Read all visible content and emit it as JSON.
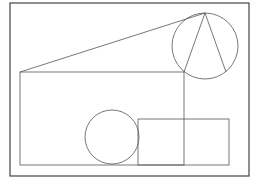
{
  "diagram": {
    "type": "geometry-figure",
    "stroke_color": "#555555",
    "frame_color": "#444444",
    "background": "#ffffff",
    "frame": {
      "x": 10,
      "y": 3,
      "width": 239,
      "height": 173
    },
    "shapes": {
      "large_circle": {
        "cx": 205,
        "cy": 46,
        "r": 33
      },
      "small_circle": {
        "cx": 112,
        "cy": 137,
        "r": 27
      },
      "triangle": {
        "points": "205,13 184,72 226,72"
      },
      "tangent_line": {
        "x1": 20,
        "y1": 72,
        "x2": 205,
        "y2": 13
      },
      "big_rectangle": {
        "x": 20,
        "y": 72,
        "width": 164,
        "height": 93
      },
      "small_rectangle": {
        "x": 138,
        "y": 119,
        "width": 91,
        "height": 46
      }
    }
  }
}
